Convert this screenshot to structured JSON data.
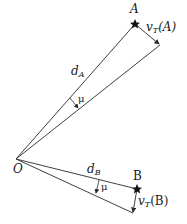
{
  "diagram": {
    "points": {
      "origin": {
        "label": "O",
        "x": 16,
        "y": 159
      },
      "A": {
        "label": "A",
        "x": 135,
        "y": 24
      },
      "A_arrow_end": {
        "x": 160,
        "y": 45
      },
      "B": {
        "label": "B",
        "x": 137,
        "y": 189
      },
      "B_arrow_end": {
        "x": 133,
        "y": 213
      }
    },
    "labels": {
      "O": "O",
      "A": "A",
      "B": "B",
      "dA_main": "d",
      "dA_sub": "A",
      "dB_main": "d",
      "dB_sub": "B",
      "vA_main": "v",
      "vA_sub": "T",
      "vA_arg": "(A)",
      "vB_main": "v",
      "vB_sub": "T",
      "vB_arg": "(B)",
      "mu_upper": "μ",
      "mu_lower": "μ"
    },
    "colors": {
      "line": "#2a2a2a",
      "text": "#1a1a1a",
      "background": "#ffffff"
    }
  }
}
